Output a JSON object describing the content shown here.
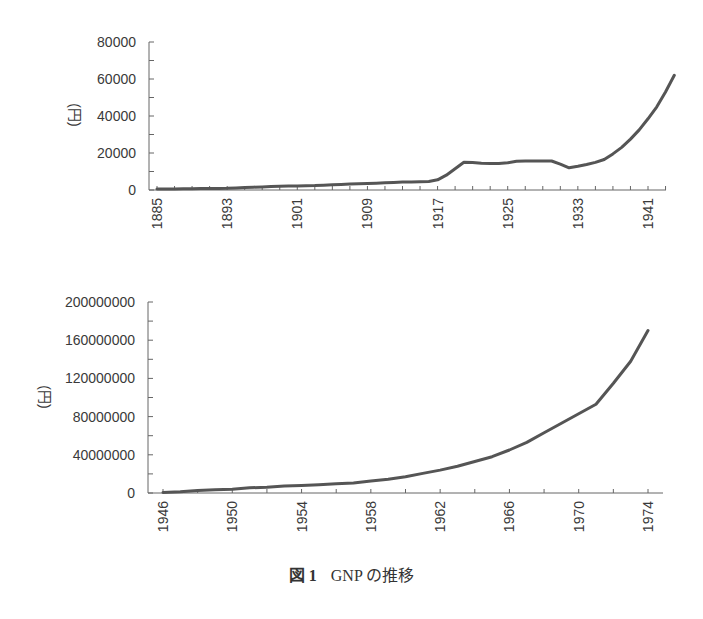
{
  "caption": {
    "figure_label": "図 1",
    "text": "GNP の推移"
  },
  "chart_data": [
    {
      "type": "line",
      "title": "",
      "xlabel": "",
      "ylabel": "(円)",
      "ylim": [
        0,
        80000
      ],
      "yticks": [
        0,
        20000,
        40000,
        60000,
        80000
      ],
      "xtick_labels": [
        "1885",
        "1893",
        "1901",
        "1909",
        "1917",
        "1925",
        "1933",
        "1941"
      ],
      "grid": false,
      "line_color": "#555555",
      "x": [
        1885,
        1886,
        1887,
        1888,
        1889,
        1890,
        1891,
        1892,
        1893,
        1894,
        1895,
        1896,
        1897,
        1898,
        1899,
        1900,
        1901,
        1902,
        1903,
        1904,
        1905,
        1906,
        1907,
        1908,
        1909,
        1910,
        1911,
        1912,
        1913,
        1914,
        1915,
        1916,
        1917,
        1918,
        1919,
        1920,
        1921,
        1922,
        1923,
        1924,
        1925,
        1926,
        1927,
        1928,
        1929,
        1930,
        1931,
        1932,
        1933,
        1934,
        1935,
        1936,
        1937,
        1938,
        1939,
        1940,
        1941,
        1942,
        1943,
        1944
      ],
      "values": [
        500,
        550,
        600,
        650,
        700,
        750,
        800,
        850,
        900,
        1100,
        1300,
        1500,
        1700,
        1900,
        2000,
        2100,
        2200,
        2300,
        2400,
        2600,
        2800,
        3000,
        3200,
        3400,
        3500,
        3700,
        3900,
        4100,
        4300,
        4400,
        4500,
        4600,
        5500,
        8000,
        11500,
        15000,
        14800,
        14500,
        14300,
        14300,
        14700,
        15500,
        15700,
        15700,
        15700,
        15700,
        14000,
        12000,
        12800,
        13800,
        14900,
        16500,
        19500,
        23000,
        27500,
        32500,
        38500,
        45000,
        53000,
        62000
      ]
    },
    {
      "type": "line",
      "title": "",
      "xlabel": "",
      "ylabel": "(円)",
      "ylim": [
        0,
        200000000
      ],
      "yticks": [
        0,
        40000000,
        80000000,
        120000000,
        160000000,
        200000000
      ],
      "xtick_labels": [
        "1946",
        "1950",
        "1954",
        "1958",
        "1962",
        "1966",
        "1970",
        "1974"
      ],
      "grid": false,
      "line_color": "#555555",
      "x": [
        1946,
        1947,
        1948,
        1949,
        1950,
        1951,
        1952,
        1953,
        1954,
        1955,
        1956,
        1957,
        1958,
        1959,
        1960,
        1961,
        1962,
        1963,
        1964,
        1965,
        1966,
        1967,
        1968,
        1969,
        1970,
        1971,
        1972,
        1973,
        1974
      ],
      "values": [
        500000,
        1300000,
        2700000,
        3400000,
        4000000,
        5400000,
        6000000,
        7200000,
        7900000,
        8700000,
        9600000,
        10600000,
        12500000,
        14500000,
        17000000,
        20500000,
        24000000,
        28000000,
        33000000,
        38000000,
        45000000,
        53000000,
        63000000,
        73000000,
        83000000,
        93000000,
        115000000,
        138000000,
        170000000
      ]
    }
  ]
}
